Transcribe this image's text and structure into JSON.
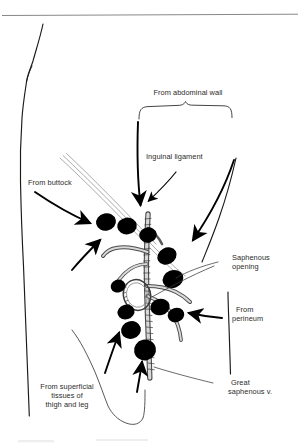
{
  "figure": {
    "kind": "anatomical-line-drawing",
    "background_color": "#ffffff",
    "ink_color": "#000000",
    "rule_color": "#7a7a7a"
  },
  "labels": {
    "abdominal_wall": "From abdominal wall",
    "inguinal_ligament": "Inguinal ligament",
    "buttock": "From buttock",
    "saphenous_opening_line1": "Saphenous",
    "saphenous_opening_line2": "opening",
    "perineum_line1": "From",
    "perineum_line2": "perineum",
    "great_saphenous_line1": "Great",
    "great_saphenous_line2": "saphenous v.",
    "superficial_line1": "From superficial",
    "superficial_line2": "tissues of",
    "superficial_line3": "thigh and leg"
  },
  "structures": {
    "lymph_nodes_count": 11,
    "vein_name": "great saphenous vein",
    "opening_name": "saphenous opening",
    "ligament_name": "inguinal ligament",
    "brace_label_target": "abdominal wall group"
  },
  "icons": {
    "arrow": "arrow-head",
    "brace": "curly-brace",
    "node": "lymph-node-ellipse",
    "vein": "vein-tube",
    "outline": "body-outline"
  }
}
